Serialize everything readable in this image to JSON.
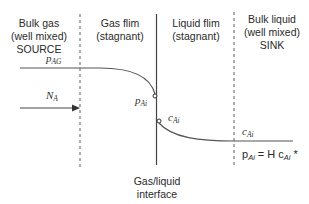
{
  "regions": [
    {
      "line1": "Bulk gas",
      "line2": "(well mixed)",
      "line3": "SOURCE"
    },
    {
      "line1": "Gas flim",
      "line2": "(stagnant)"
    },
    {
      "line1": "Liquid flim",
      "line2": "(stagnant)"
    },
    {
      "line1": "Bulk liquid",
      "line2": "(well mixed)",
      "line3": "SINK"
    }
  ],
  "interface_label": {
    "line1": "Gas/liquid",
    "line2": "interface"
  },
  "symbols": {
    "p_AG": {
      "base": "p",
      "sub": "AG"
    },
    "N_A": {
      "base": "N",
      "sub": "A"
    },
    "p_Ai": {
      "base": "p",
      "sub": "Ai"
    },
    "c_Ai_interface": {
      "base": "c",
      "sub": "Ai"
    },
    "c_Ai_bulk": {
      "base": "c",
      "sub": "Ai"
    }
  },
  "equation": {
    "lhs_base": "p",
    "lhs_sub": "Ai",
    "middle": " = H c",
    "rhs_sub": "Ai",
    "suffix": " *"
  },
  "colors": {
    "line": "#555555",
    "dashed": "#777777"
  }
}
